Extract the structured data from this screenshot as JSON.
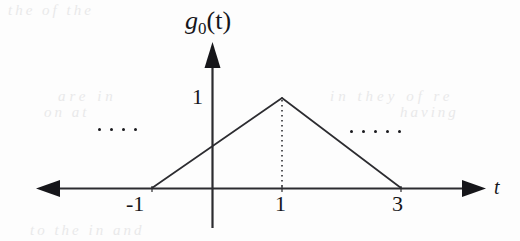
{
  "figure": {
    "kind": "triangular-pulse-plot",
    "background_color": "#fdfdfd",
    "ink_color": "#16161a"
  },
  "axes": {
    "vertical": {
      "label": "g",
      "label_subscript": "0",
      "label_argument": "(t)",
      "value_tick_label": "1"
    },
    "horizontal": {
      "label": "t",
      "tick_labels": [
        "-1",
        "1",
        "3"
      ]
    }
  },
  "continuation": {
    "left_ellipsis_dot_count": 4,
    "right_ellipsis_dot_count": 5
  },
  "ghost_text": {
    "top": "the of the",
    "middle_left": "are in",
    "middle_right": "in they of re",
    "low_left": "on at",
    "low_right": "having",
    "bottom": "to the in and"
  },
  "chart_data": {
    "type": "line",
    "title": "",
    "xlabel": "t",
    "ylabel": "g0(t)",
    "xlim": [
      -2.6,
      4.6
    ],
    "ylim": [
      0,
      1.35
    ],
    "grid": false,
    "legend": null,
    "xticks": [
      -1,
      1,
      3
    ],
    "xticklabels": [
      "-1",
      "1",
      "3"
    ],
    "yticks": [
      1
    ],
    "yticklabels": [
      "1"
    ],
    "series": [
      {
        "name": "g0(t)",
        "x": [
          -1,
          1,
          3
        ],
        "y": [
          0,
          1,
          0
        ],
        "style": "solid",
        "color": "#2c2c30"
      },
      {
        "name": "peak-marker",
        "x": [
          1,
          1
        ],
        "y": [
          0,
          1
        ],
        "style": "dotted",
        "color": "#2c2c30"
      }
    ],
    "annotations": [
      {
        "text": "....",
        "x": -2.0,
        "y": 0.45
      },
      {
        "text": ".....",
        "x": 3.35,
        "y": 0.42
      }
    ]
  }
}
